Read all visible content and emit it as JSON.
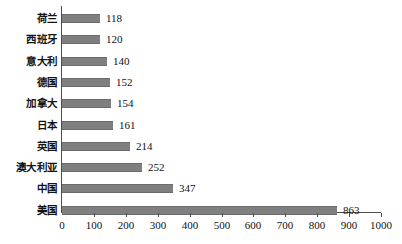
{
  "chart_data": {
    "type": "bar",
    "orientation": "horizontal",
    "title": "",
    "subtitle": "",
    "xlabel": "",
    "ylabel": "",
    "categories": [
      "荷兰",
      "西班牙",
      "意大利",
      "德国",
      "加拿大",
      "日本",
      "英国",
      "澳大利亚",
      "中国",
      "美国"
    ],
    "values": [
      118,
      120,
      140,
      152,
      154,
      161,
      214,
      252,
      347,
      863
    ],
    "xlim": [
      0,
      1000
    ],
    "xticks": [
      0,
      100,
      200,
      300,
      400,
      500,
      600,
      700,
      800,
      900,
      1000
    ],
    "xticklabels": [
      "0",
      "100",
      "200",
      "300",
      "400",
      "500",
      "600",
      "700",
      "800",
      "900",
      "1000"
    ],
    "grid": false,
    "legend": null,
    "legend_position": "none",
    "data_labels": true,
    "bar_color": "#7f7f7f",
    "axis_color": "#4d4d4d",
    "background_color": "#ffffff",
    "text_color": "#111111"
  },
  "chart": {
    "bars": [
      {
        "label": "荷兰",
        "value": 118,
        "value_text": "118"
      },
      {
        "label": "西班牙",
        "value": 120,
        "value_text": "120"
      },
      {
        "label": "意大利",
        "value": 140,
        "value_text": "140"
      },
      {
        "label": "德国",
        "value": 152,
        "value_text": "152"
      },
      {
        "label": "加拿大",
        "value": 154,
        "value_text": "154"
      },
      {
        "label": "日本",
        "value": 161,
        "value_text": "161"
      },
      {
        "label": "英国",
        "value": 214,
        "value_text": "214"
      },
      {
        "label": "澳大利亚",
        "value": 252,
        "value_text": "252"
      },
      {
        "label": "中国",
        "value": 347,
        "value_text": "347"
      },
      {
        "label": "美国",
        "value": 863,
        "value_text": "863"
      }
    ],
    "axis": {
      "ticks": [
        "0",
        "100",
        "200",
        "300",
        "400",
        "500",
        "600",
        "700",
        "800",
        "900",
        "1000"
      ]
    }
  }
}
